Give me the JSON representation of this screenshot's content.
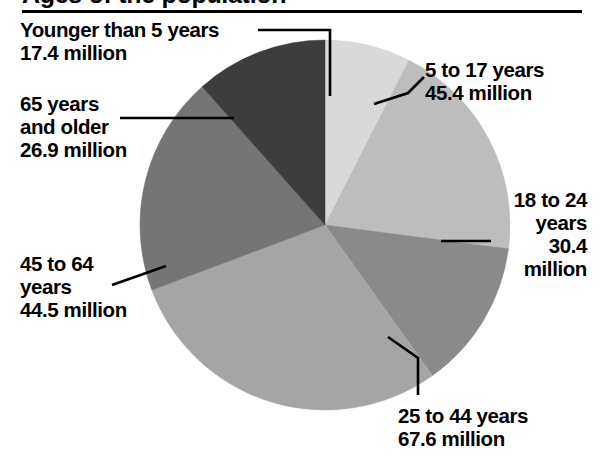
{
  "header": {
    "title": "Ages of the population",
    "title_cropped": true,
    "rule_color": "#000000"
  },
  "chart_data": {
    "type": "pie",
    "title": "Ages of the population",
    "unit": "million",
    "total": 232.2,
    "center": {
      "x": 325,
      "y": 225
    },
    "radius": 185,
    "start_angle_deg": 0,
    "direction": "clockwise",
    "legend": "none",
    "grid": false,
    "categories": [
      "Younger than 5 years",
      "5 to 17 years",
      "18 to 24 years",
      "25 to 44 years",
      "45 to 64 years",
      "65 years and older"
    ],
    "values": [
      17.4,
      45.4,
      30.4,
      67.6,
      44.5,
      26.9
    ],
    "slices": [
      {
        "label_line1": "Younger than 5 years",
        "label_line2": "17.4 million",
        "value": 17.4,
        "color": "#d9d9d9",
        "start_deg": 0,
        "end_deg": 27.0
      },
      {
        "label_line1": "5 to 17 years",
        "label_line2": "45.4 million",
        "value": 45.4,
        "color": "#bdbdbd",
        "start_deg": 27.0,
        "end_deg": 97.4
      },
      {
        "label_line1": "18 to 24",
        "label_line2": "years",
        "label_line3": "30.4",
        "label_line4": "million",
        "value": 30.4,
        "color": "#8a8a8a",
        "start_deg": 97.4,
        "end_deg": 144.5
      },
      {
        "label_line1": "25 to 44 years",
        "label_line2": "67.6 million",
        "value": 67.6,
        "color": "#a5a5a5",
        "start_deg": 144.5,
        "end_deg": 249.4
      },
      {
        "label_line1": "45 to 64",
        "label_line2": "years",
        "label_line3": "44.5 million",
        "value": 44.5,
        "color": "#757575",
        "start_deg": 249.4,
        "end_deg": 318.4
      },
      {
        "label_line1": "65 years",
        "label_line2": "and older",
        "label_line3": "26.9 million",
        "value": 26.9,
        "color": "#3d3d3d",
        "start_deg": 318.4,
        "end_deg": 360.0
      }
    ]
  },
  "labels": {
    "younger_than_5": "Younger than 5 years\n17.4 million",
    "age_65_older": "65 years\nand older\n26.9 million",
    "age_45_64": "45 to 64\nyears\n44.5 million",
    "age_5_17": "5 to 17 years\n45.4 million",
    "age_18_24": "18 to 24\nyears\n30.4\nmillion",
    "age_25_44": "25 to 44 years\n67.6 million"
  }
}
